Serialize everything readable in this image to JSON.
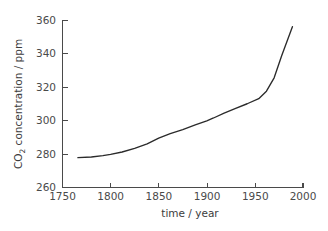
{
  "chart_data": {
    "type": "line",
    "title": "",
    "xlabel": "time / year",
    "ylabel": "CO2 concentration / ppm",
    "ylabel_prefix": "CO",
    "ylabel_subscript": "2",
    "ylabel_suffix": " concentration / ppm",
    "xlim": [
      1750,
      2000
    ],
    "ylim": [
      260,
      360
    ],
    "xticks": [
      1750,
      1800,
      1850,
      1900,
      1950,
      2000
    ],
    "xtick_labels": [
      "1750",
      "1800",
      "1850",
      "1900",
      "1950",
      "2000"
    ],
    "yticks": [
      260,
      280,
      300,
      320,
      340,
      360
    ],
    "ytick_labels": [
      "260",
      "280",
      "300",
      "320",
      "340",
      "360"
    ],
    "grid": false,
    "legend": false,
    "line_color": "#2b2b2b",
    "axis_color": "#4a4a4a",
    "background_color": "#ffffff",
    "series": [
      {
        "name": "CO2 concentration",
        "x": [
          1766,
          1780,
          1792,
          1800,
          1812,
          1825,
          1838,
          1850,
          1862,
          1875,
          1888,
          1900,
          1907,
          1918,
          1930,
          1942,
          1954,
          1962,
          1970,
          1978,
          1989
        ],
        "values": [
          277.8,
          278.2,
          279.0,
          279.8,
          281.2,
          283.4,
          286.0,
          289.5,
          292.2,
          294.6,
          297.4,
          299.8,
          301.5,
          304.4,
          307.2,
          310.0,
          313.0,
          317.5,
          325.5,
          339.0,
          356.0
        ]
      }
    ]
  }
}
